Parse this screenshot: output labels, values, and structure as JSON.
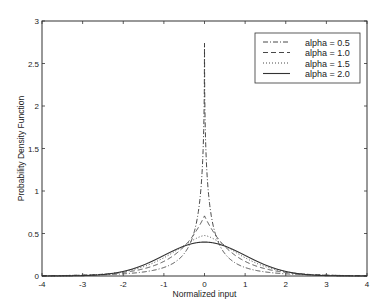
{
  "chart_data": {
    "type": "line",
    "title": "",
    "xlabel": "Normalized input",
    "ylabel": "Probability Density Function",
    "xlim": [
      -4,
      4
    ],
    "ylim": [
      0,
      3
    ],
    "xticks": [
      -4,
      -3,
      -2,
      -1,
      0,
      1,
      2,
      3,
      4
    ],
    "yticks": [
      0,
      0.5,
      1,
      1.5,
      2,
      2.5,
      3
    ],
    "ytick_labels": [
      "0",
      "0.5",
      "1",
      "1.5",
      "2",
      "2.5",
      "3"
    ],
    "grid": false,
    "legend_position": "upper right",
    "series": [
      {
        "name": "alpha = 0.5",
        "alpha": 0.5,
        "style": "dashdot",
        "peak": 2.74,
        "x": [
          -4,
          -3,
          -2,
          -1,
          -0.5,
          -0.25,
          -0.1,
          0,
          0.1,
          0.25,
          0.5,
          1,
          2,
          3,
          4
        ],
        "y": [
          0.007,
          0.014,
          0.03,
          0.08,
          0.18,
          0.4,
          0.95,
          2.74,
          0.95,
          0.4,
          0.18,
          0.08,
          0.03,
          0.014,
          0.007
        ]
      },
      {
        "name": "alpha = 1.0",
        "alpha": 1.0,
        "style": "dashed",
        "peak": 0.707,
        "x": [
          -4,
          -3,
          -2,
          -1,
          -0.5,
          0,
          0.5,
          1,
          2,
          3,
          4
        ],
        "y": [
          0.002,
          0.01,
          0.042,
          0.172,
          0.348,
          0.707,
          0.348,
          0.172,
          0.042,
          0.01,
          0.002
        ]
      },
      {
        "name": "alpha = 1.5",
        "alpha": 1.5,
        "style": "dotted",
        "peak": 0.476,
        "x": [
          -4,
          -3,
          -2,
          -1,
          -0.5,
          0,
          0.5,
          1,
          2,
          3,
          4
        ],
        "y": [
          0.0,
          0.003,
          0.035,
          0.22,
          0.38,
          0.476,
          0.38,
          0.22,
          0.035,
          0.003,
          0.0
        ]
      },
      {
        "name": "alpha = 2.0",
        "alpha": 2.0,
        "style": "solid",
        "peak": 0.399,
        "x": [
          -4,
          -3,
          -2,
          -1,
          -0.5,
          0,
          0.5,
          1,
          2,
          3,
          4
        ],
        "y": [
          0.0001,
          0.004,
          0.054,
          0.242,
          0.352,
          0.399,
          0.352,
          0.242,
          0.054,
          0.004,
          0.0001
        ]
      }
    ]
  },
  "layout": {
    "plot_left": 42,
    "plot_right": 367,
    "plot_top": 21,
    "plot_bottom": 276
  }
}
